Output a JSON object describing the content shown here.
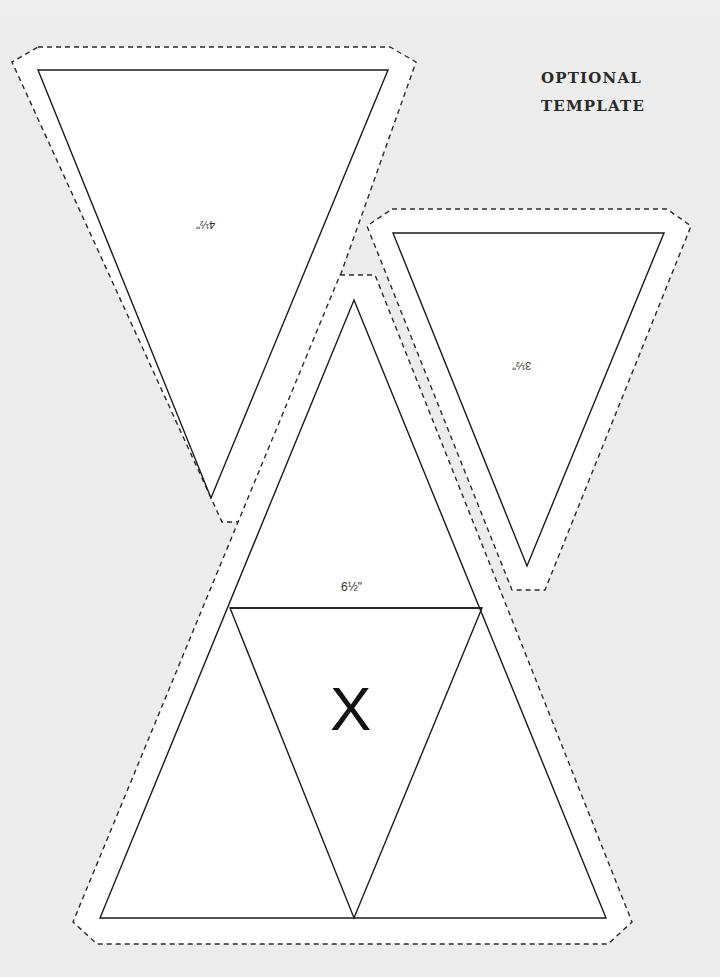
{
  "heading": {
    "line1": "OPTIONAL",
    "line2": "TEMPLATE"
  },
  "pieces": [
    {
      "id": "large-pennant",
      "size_label": "4½\"",
      "orientation": "upside-down",
      "cut_line": "38,47 390,47 416,62 253,522 222,522 12,62",
      "shape": "38,70 388,70 211,498"
    },
    {
      "id": "small-pennant",
      "size_label": "3½\"",
      "orientation": "upside-down",
      "cut_line": "392,209 667,209 691,226 545,590 512,590 367,226",
      "shape": "393,233 664,233 527,566"
    },
    {
      "id": "big-triangle",
      "size_label": "6½\"",
      "cut_line": "340,275 375,275 632,922 608,944 97,944 73,922",
      "shape": "354,300 606,918 100,918",
      "divider_line": "230,608 482,608",
      "inner_triangle": "230,608 482,608 354,918",
      "center_mark": "X"
    }
  ],
  "colors": {
    "background": "#efefef",
    "paper": "#ffffff",
    "line": "#1a1a1a",
    "dash": "#2a2a2a"
  }
}
